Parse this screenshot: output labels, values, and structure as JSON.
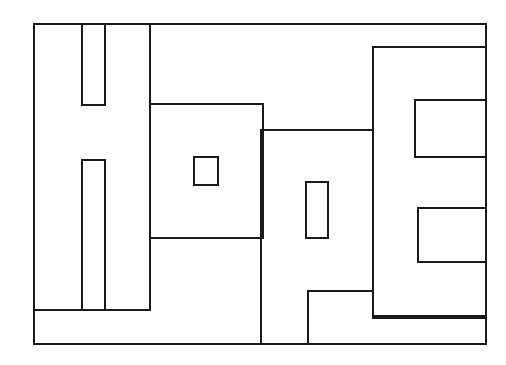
{
  "document": {
    "title": "Hope",
    "type": "line-art-outline-drawing",
    "subject": "The word \"Hope\" drawn as hollow block letters inside a rectangular border",
    "word": "Hope",
    "background_color": "#ffffff",
    "stroke_color": "#1a1a1a",
    "stroke_width": 2,
    "canvas": {
      "width": 506,
      "height": 365
    }
  },
  "drawing": {
    "frame": {
      "label": "outer-rectangle-border",
      "x": 34,
      "y": 24,
      "width": 452,
      "height": 320,
      "right": 486,
      "bottom": 344
    },
    "letters": [
      {
        "letter": "H",
        "label": "block-letter-h",
        "left": 34,
        "right": 150,
        "top": 24,
        "bottom": 310,
        "notch_top": {
          "x1": 82,
          "x2": 105,
          "y_top": 24,
          "y_bottom": 105
        },
        "notch_bottom": {
          "x1": 82,
          "x2": 105,
          "y_top": 160,
          "y_bottom": 310
        }
      },
      {
        "letter": "o",
        "label": "block-letter-o",
        "left": 150,
        "right": 263,
        "top": 104,
        "bottom": 238,
        "hole": {
          "x": 194,
          "y": 157,
          "width": 24,
          "height": 28
        }
      },
      {
        "letter": "p",
        "label": "block-letter-p",
        "left": 261,
        "right": 373,
        "top": 130,
        "bottom": 344,
        "hole": {
          "x": 306,
          "y": 182,
          "width": 22,
          "height": 56
        },
        "descender_notch": {
          "x_left": 308,
          "y_top": 291,
          "x_right": 373,
          "y_bottom": 316
        }
      },
      {
        "letter": "E",
        "label": "block-letter-e",
        "left": 373,
        "right": 486,
        "top": 47,
        "bottom": 318,
        "upper_bar_gap": {
          "x": 415,
          "y": 100,
          "width": 71,
          "height": 57
        },
        "lower_bar_gap": {
          "x": 418,
          "y": 208,
          "width": 68,
          "height": 54
        }
      }
    ],
    "paths": {
      "frame_outline": "M 34 24 L 486 24 L 486 344 L 34 344 Z",
      "h_upper_notch": "M 82 24 L 82 105 L 105 105 L 105 24",
      "h_lower_notch": "M 82 310 L 82 160 L 105 160 L 105 310",
      "h_right_stem": "M 150 24 L 150 310",
      "h_baseline": "M 34 310 L 150 310",
      "h_lower_notch_base": "M 105 310 L 150 310",
      "o_outline": "M 150 104 L 263 104 L 263 238 L 150 238",
      "o_hole": "M 194 157 L 218 157 L 218 185 L 194 185 Z",
      "p_top": "M 261 130 L 373 130",
      "p_left_stem": "M 261 130 L 261 344",
      "p_right_stem": "M 373 130 L 373 316",
      "p_hole": "M 306 182 L 328 182 L 328 238 L 306 238 Z",
      "p_descender_notch": "M 308 344 L 308 291 L 373 291 L 373 316 L 486 316",
      "e_top": "M 373 47 L 486 47",
      "e_left_stem": "M 373 47 L 373 318",
      "e_upper_gap": "M 486 100 L 415 100 L 415 157 L 486 157",
      "e_lower_gap": "M 486 208 L 418 208 L 418 262 L 486 262",
      "e_bottom": "M 373 318 L 486 318"
    }
  },
  "accessibility": {
    "alt_text": "Outline line drawing of the word Hope in hollow block capital and lowercase letters enclosed in a rectangular border"
  }
}
